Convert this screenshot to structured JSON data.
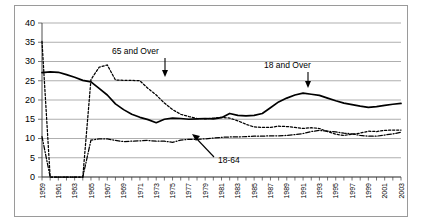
{
  "chart_data": {
    "type": "line",
    "title": "",
    "xlabel": "",
    "ylabel": "",
    "ylim": [
      0,
      40
    ],
    "ytick_step": 5,
    "yticks": [
      "0",
      "5",
      "10",
      "15",
      "20",
      "25",
      "30",
      "35",
      "40"
    ],
    "grid": true,
    "legend": "inline-annotations",
    "x": [
      1959,
      1960,
      1961,
      1962,
      1963,
      1964,
      1965,
      1966,
      1967,
      1968,
      1969,
      1970,
      1971,
      1972,
      1973,
      1974,
      1975,
      1976,
      1977,
      1978,
      1979,
      1980,
      1981,
      1982,
      1983,
      1984,
      1985,
      1986,
      1987,
      1988,
      1989,
      1990,
      1991,
      1992,
      1993,
      1994,
      1995,
      1996,
      1997,
      1998,
      1999,
      2000,
      2001,
      2002,
      2003
    ],
    "xtick_labels": [
      "1959",
      "1961",
      "1963",
      "1965",
      "1967",
      "1969",
      "1971",
      "1973",
      "1975",
      "1977",
      "1979",
      "1981",
      "1983",
      "1985",
      "1987",
      "1989",
      "1991",
      "1993",
      "1995",
      "1997",
      "1999",
      "2001",
      "2003"
    ],
    "series": [
      {
        "name": "18 and Over",
        "style": "solid",
        "label": "18 and Over",
        "values": [
          27.1,
          27.3,
          27.2,
          26.6,
          25.9,
          25.1,
          24.7,
          23.0,
          21.3,
          19.0,
          17.5,
          16.3,
          15.5,
          14.9,
          14.1,
          15.0,
          15.3,
          15.2,
          15.0,
          15.1,
          15.2,
          15.1,
          15.4,
          16.5,
          16.0,
          15.9,
          16.0,
          16.5,
          18.0,
          19.5,
          20.5,
          21.3,
          21.8,
          21.5,
          21.2,
          20.5,
          19.8,
          19.2,
          18.8,
          18.4,
          18.1,
          18.3,
          18.6,
          18.9,
          19.1
        ]
      },
      {
        "name": "65 and Over",
        "style": "dotted",
        "label": "65 and Over",
        "values": [
          35.2,
          0,
          0,
          0,
          0,
          0,
          25.3,
          28.5,
          29.1,
          25.2,
          25.1,
          25.1,
          25.0,
          23.0,
          21.3,
          19.2,
          17.5,
          16.3,
          15.7,
          15.2,
          15.1,
          15.3,
          15.5,
          15.3,
          14.6,
          13.7,
          13.0,
          12.9,
          12.9,
          13.2,
          13.1,
          12.9,
          12.6,
          12.8,
          12.6,
          11.8,
          11.1,
          10.8,
          11.1,
          11.4,
          11.9,
          11.8,
          12.1,
          12.2,
          12.2
        ]
      },
      {
        "name": "18-64",
        "style": "dash-dot",
        "label": "18-64",
        "values": [
          10.5,
          0,
          0,
          0,
          0,
          0,
          9.6,
          9.9,
          9.9,
          9.5,
          9.2,
          9.3,
          9.4,
          9.5,
          9.3,
          9.3,
          9.0,
          9.6,
          9.8,
          9.8,
          9.9,
          10.1,
          10.3,
          10.4,
          10.4,
          10.5,
          10.6,
          10.6,
          10.7,
          10.7,
          10.8,
          11.0,
          11.3,
          11.8,
          12.1,
          11.9,
          11.7,
          11.4,
          11.2,
          10.8,
          10.6,
          10.6,
          10.9,
          11.2,
          11.6
        ]
      }
    ],
    "annotations": [
      {
        "text": "65 and Over",
        "points_to_series": "65 and Over",
        "arrow": "down"
      },
      {
        "text": "18 and Over",
        "points_to_series": "18 and Over",
        "arrow": "down"
      },
      {
        "text": "18-64",
        "points_to_series": "18-64",
        "arrow": "up-left"
      }
    ]
  }
}
